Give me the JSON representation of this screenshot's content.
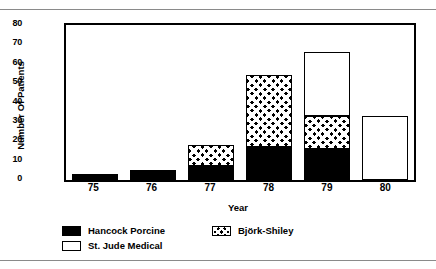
{
  "chart_data": {
    "type": "bar",
    "subtype": "stacked",
    "title": "",
    "xlabel": "Year",
    "ylabel": "Number Of Patients",
    "categories": [
      "75",
      "76",
      "77",
      "78",
      "79",
      "80"
    ],
    "ylim": [
      0,
      80
    ],
    "yticks": [
      0,
      10,
      20,
      30,
      40,
      50,
      60,
      70,
      80
    ],
    "grid": false,
    "legend_position": "bottom-left",
    "series": [
      {
        "name": "Hancock Porcine",
        "fill": "solid-black",
        "color": "#000000",
        "values": [
          3,
          5,
          7,
          17,
          16,
          0
        ]
      },
      {
        "name": "Björk-Shiley",
        "fill": "crosshatch",
        "color": "#000000",
        "values": [
          0,
          0,
          11,
          37,
          17,
          0
        ]
      },
      {
        "name": "St. Jude Medical",
        "fill": "white",
        "color": "#ffffff",
        "values": [
          0,
          0,
          0,
          0,
          33,
          33
        ]
      }
    ],
    "totals": [
      3,
      5,
      18,
      54,
      66,
      33
    ]
  },
  "axes": {
    "y_title": "Number Of Patients",
    "x_title": "Year",
    "y_tick_labels": [
      "80",
      "70",
      "60",
      "50",
      "40",
      "30",
      "20",
      "10",
      "0"
    ],
    "x_tick_labels": [
      "75",
      "76",
      "77",
      "78",
      "79",
      "80"
    ]
  },
  "legend": {
    "items": [
      {
        "label": "Hancock Porcine",
        "swatch": "solid-black-swatch"
      },
      {
        "label": "Björk-Shiley",
        "swatch": "crosshatch-swatch"
      },
      {
        "label": "St. Jude Medical",
        "swatch": "white-outline-swatch"
      }
    ]
  },
  "colors": {
    "foreground": "#000000",
    "background": "#ffffff",
    "rule": "#8a8a8a"
  }
}
